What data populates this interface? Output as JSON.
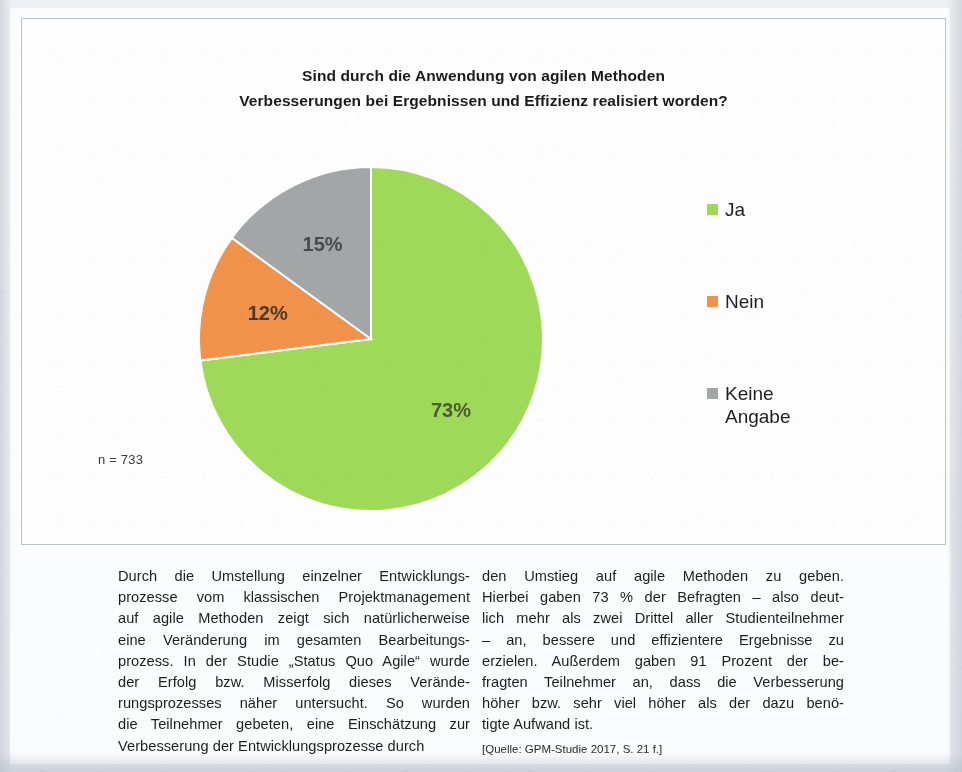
{
  "figure": {
    "title_line_1": "Sind durch die Anwendung von agilen Methoden",
    "title_line_2": "Verbesserungen bei Ergebnissen und Effizienz realisiert worden?",
    "sample_note": "n = 733"
  },
  "chart_data": {
    "type": "pie",
    "title": "Sind durch die Anwendung von agilen Methoden Verbesserungen bei Ergebnissen und Effizienz realisiert worden?",
    "xlabel": "",
    "ylabel": "",
    "grid": false,
    "legend_position": "right",
    "sample_size": 733,
    "sample_label": "n = 733",
    "unit": "%",
    "start_angle_deg": 0,
    "direction": "clockwise",
    "categories": [
      "Ja",
      "Nein",
      "Keine Angabe"
    ],
    "values": [
      73,
      12,
      15
    ],
    "data_labels": [
      "73%",
      "12%",
      "15%"
    ],
    "colors": [
      "#9ED957",
      "#F0924A",
      "#A2A6A6"
    ],
    "slices": [
      {
        "label": "Ja",
        "value": 73,
        "data_label": "73%",
        "color": "#9ED957"
      },
      {
        "label": "Nein",
        "value": 12,
        "data_label": "12%",
        "color": "#F0924A"
      },
      {
        "label": "Keine Angabe",
        "value": 15,
        "data_label": "15%",
        "color": "#A2A6A6"
      }
    ]
  },
  "legend": {
    "items": [
      {
        "key": "ja",
        "label": "Ja",
        "color": "#9ED957"
      },
      {
        "key": "nein",
        "label": "Nein",
        "color": "#F0924A"
      },
      {
        "key": "keine",
        "label": "Keine\nAngabe",
        "color": "#A2A6A6"
      }
    ]
  },
  "body": {
    "left_column": {
      "lines": [
        "Durch die Umstellung einzelner Entwicklungs-",
        "prozesse vom klassischen Projektmanagement",
        "auf agile Methoden zeigt sich natürlicherweise",
        "eine Veränderung im gesamten Bearbeitungs-",
        "prozess. In der Studie „Status Quo Agile“ wurde",
        "der Erfolg bzw. Misserfolg dieses Verände-",
        "rungsprozesses näher untersucht. So wurden",
        "die Teilnehmer gebeten, eine Einschätzung zur",
        "Verbesserung der Entwicklungsprozesse durch"
      ]
    },
    "right_column": {
      "lines": [
        "den Umstieg auf agile Methoden zu geben.",
        "Hierbei gaben 73 % der Befragten – also deut-",
        "lich mehr als zwei Drittel aller Studienteilnehmer",
        "– an, bessere und effizientere Ergebnisse zu",
        "erzielen. Außerdem gaben 91 Prozent der be-",
        "fragten Teilnehmer an, dass die Verbesserung",
        "höher bzw. sehr viel höher als der dazu benö-",
        "tigte Aufwand ist."
      ],
      "source": "[Quelle: GPM-Studie 2017, S. 21 f.]"
    }
  }
}
